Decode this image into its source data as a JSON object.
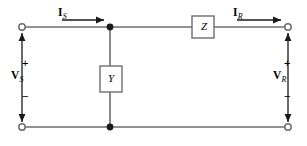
{
  "diagram": {
    "type": "circuit-schematic",
    "background_color": "#ffffff",
    "wire_color": "#6e6e6e",
    "ink_color": "#1a1a1a",
    "labels": {
      "source_current": "I",
      "source_current_subscript": "S",
      "receiving_current": "I",
      "receiving_current_subscript": "R",
      "source_voltage": "V",
      "source_voltage_subscript": "S",
      "receiving_voltage": "V",
      "receiving_voltage_subscript": "R",
      "series_element": "Z",
      "shunt_element": "Y",
      "plus_sign": "+",
      "minus_sign": "−"
    },
    "components": [
      {
        "name": "series-impedance",
        "label": "Z",
        "orientation": "horizontal",
        "x": 192,
        "y": 16,
        "w": 22,
        "h": 22
      },
      {
        "name": "shunt-admittance",
        "label": "Y",
        "orientation": "vertical",
        "x": 100,
        "y": 66,
        "w": 22,
        "h": 26
      }
    ],
    "nodes": [
      {
        "name": "terminal-top-left",
        "style": "open-circle",
        "x": 22,
        "y": 27
      },
      {
        "name": "terminal-bottom-left",
        "style": "open-circle",
        "x": 22,
        "y": 127
      },
      {
        "name": "terminal-top-right",
        "style": "open-circle",
        "x": 288,
        "y": 27
      },
      {
        "name": "terminal-bottom-right",
        "style": "open-circle",
        "x": 288,
        "y": 127
      },
      {
        "name": "junction-top-center",
        "style": "filled-dot",
        "x": 110,
        "y": 27
      },
      {
        "name": "junction-bottom-center",
        "style": "filled-dot",
        "x": 110,
        "y": 127
      }
    ],
    "current_arrows": [
      {
        "name": "current-arrow-source",
        "direction": "right",
        "x1": 62,
        "x2": 110,
        "y": 20
      },
      {
        "name": "current-arrow-receiving",
        "direction": "right",
        "x1": 237,
        "x2": 285,
        "y": 20
      }
    ],
    "voltage_arrows": [
      {
        "name": "voltage-arrow-source",
        "direction": "up",
        "x": 22,
        "y1": 120,
        "y2": 33
      },
      {
        "name": "voltage-arrow-receiving",
        "direction": "up",
        "x": 288,
        "y1": 120,
        "y2": 33
      }
    ]
  }
}
